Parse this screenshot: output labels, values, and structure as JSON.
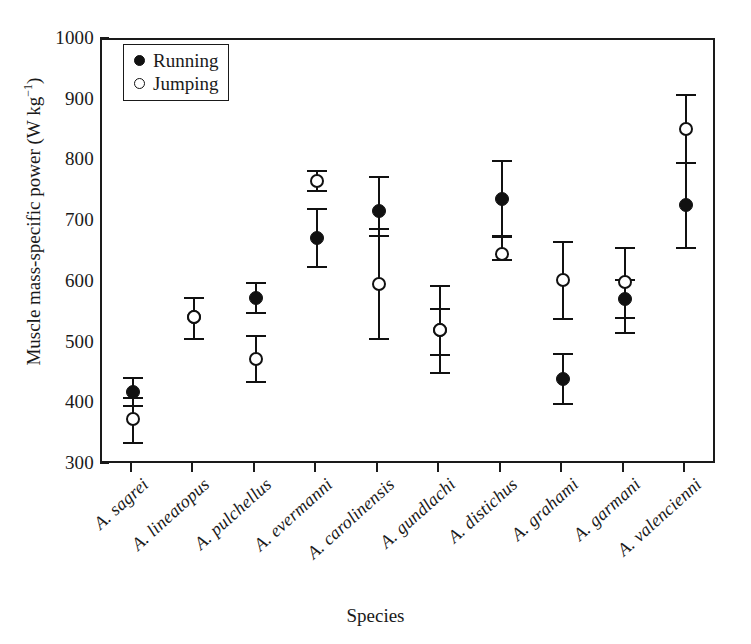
{
  "chart": {
    "type": "scatter",
    "title": "",
    "xlabel": "Species",
    "ylabel_text": "Muscle mass-specific power (W kg",
    "ylabel_sup": "−1",
    "ylabel_tail": ")",
    "ylim": [
      300,
      1000
    ],
    "ytick_values": [
      "1000",
      "900",
      "800",
      "700",
      "600",
      "500",
      "400",
      "300"
    ],
    "grid": false,
    "legend_position": "top-left",
    "frame": true
  },
  "legend": {
    "entries": [
      {
        "label": "Running",
        "marker": "filled-circle",
        "color": "#111111"
      },
      {
        "label": "Jumping",
        "marker": "open-circle",
        "color": "#111111"
      }
    ]
  },
  "chart_data": {
    "type": "scatter",
    "title": "",
    "xlabel": "Species",
    "ylabel": "Muscle mass-specific power (W kg−1)",
    "ylim": [
      300,
      1000
    ],
    "yticks": [
      300,
      400,
      500,
      600,
      700,
      800,
      900,
      1000
    ],
    "grid": false,
    "legend_position": "top-left",
    "categories": [
      "A. sagrei",
      "A. lineatopus",
      "A. pulchellus",
      "A. evermanni",
      "A. carolinensis",
      "A. gundlachi",
      "A. distichus",
      "A. grahami",
      "A. garmani",
      "A. valencienni"
    ],
    "series": [
      {
        "name": "Running",
        "marker": "filled-circle",
        "values": [
          420,
          543,
          575,
          674,
          718,
          523,
          738,
          442,
          573,
          728
        ],
        "err_low": [
          398,
          508,
          550,
          626,
          678,
          482,
          678,
          400,
          542,
          658
        ],
        "err_high": [
          443,
          575,
          600,
          722,
          775,
          557,
          800,
          483,
          605,
          798
        ]
      },
      {
        "name": "Jumping",
        "marker": "open-circle",
        "values": [
          375,
          543,
          475,
          768,
          598,
          523,
          648,
          605,
          602,
          853
        ],
        "err_low": [
          337,
          508,
          437,
          752,
          508,
          452,
          638,
          541,
          517,
          798
        ],
        "err_high": [
          410,
          575,
          512,
          785,
          688,
          595,
          675,
          667,
          658,
          910
        ]
      }
    ]
  }
}
